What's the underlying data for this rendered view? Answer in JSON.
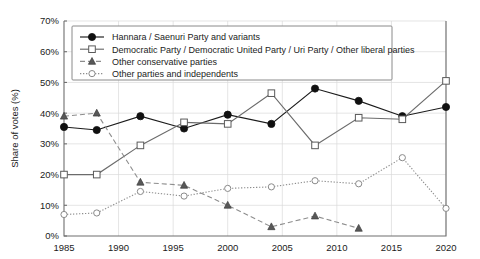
{
  "chart_data": {
    "type": "line",
    "title": "",
    "subtitle": "",
    "xlabel": "",
    "ylabel": "Share of votes (%)",
    "xlim": [
      1985,
      2020
    ],
    "ylim": [
      0,
      70
    ],
    "x_ticks": [
      "1985",
      "1990",
      "1995",
      "2000",
      "2005",
      "2010",
      "2015",
      "2020"
    ],
    "x_tick_values": [
      1985,
      1990,
      1995,
      2000,
      2005,
      2010,
      2015,
      2020
    ],
    "y_ticks": [
      "0%",
      "10%",
      "20%",
      "30%",
      "40%",
      "50%",
      "60%",
      "70%"
    ],
    "y_tick_values": [
      0,
      10,
      20,
      30,
      40,
      50,
      60,
      70
    ],
    "grid": true,
    "legend_position": "top-center",
    "x": [
      1985,
      1988,
      1992,
      1996,
      2000,
      2004,
      2008,
      2012,
      2016,
      2020
    ],
    "series": [
      {
        "name": "Hannara / Saenuri Party and variants",
        "marker": "filled-circle",
        "linestyle": "solid",
        "color": "#101010",
        "x": [
          1985,
          1988,
          1992,
          1996,
          2000,
          2004,
          2008,
          2012,
          2016,
          2020
        ],
        "values": [
          35.5,
          34.5,
          39,
          35,
          39.5,
          36.5,
          48,
          44,
          39,
          42
        ]
      },
      {
        "name": "Democratic Party / Democratic United Party / Uri Party / Other liberal parties",
        "marker": "open-square",
        "linestyle": "solid",
        "color": "#6b6b6b",
        "x": [
          1985,
          1988,
          1992,
          1996,
          2000,
          2004,
          2008,
          2012,
          2016,
          2020
        ],
        "values": [
          20,
          20,
          29.5,
          37,
          36.5,
          46.5,
          29.5,
          38.5,
          38,
          50.5
        ]
      },
      {
        "name": "Other conservative parties",
        "marker": "filled-triangle",
        "linestyle": "dashed",
        "color": "#585858",
        "x": [
          1985,
          1988,
          1992,
          1996,
          2000,
          2004,
          2008,
          2012
        ],
        "values": [
          39,
          40,
          17.5,
          16.5,
          10,
          3,
          6.5,
          2.5
        ]
      },
      {
        "name": "Other parties and independents",
        "marker": "open-circle",
        "linestyle": "dotted",
        "color": "#8a8a8a",
        "x": [
          1985,
          1988,
          1992,
          1996,
          2000,
          2004,
          2008,
          2012,
          2016,
          2020
        ],
        "values": [
          7,
          7.5,
          14.5,
          13,
          15.5,
          16,
          18,
          17,
          25.5,
          9
        ]
      }
    ]
  },
  "axes": {
    "y_axis_title": "Share of votes (%)"
  },
  "legend": {
    "items": [
      {
        "label": "Hannara / Saenuri Party and variants"
      },
      {
        "label": "Democratic Party / Democratic United Party / Uri Party / Other liberal parties"
      },
      {
        "label": "Other conservative parties"
      },
      {
        "label": "Other parties and independents"
      }
    ]
  }
}
